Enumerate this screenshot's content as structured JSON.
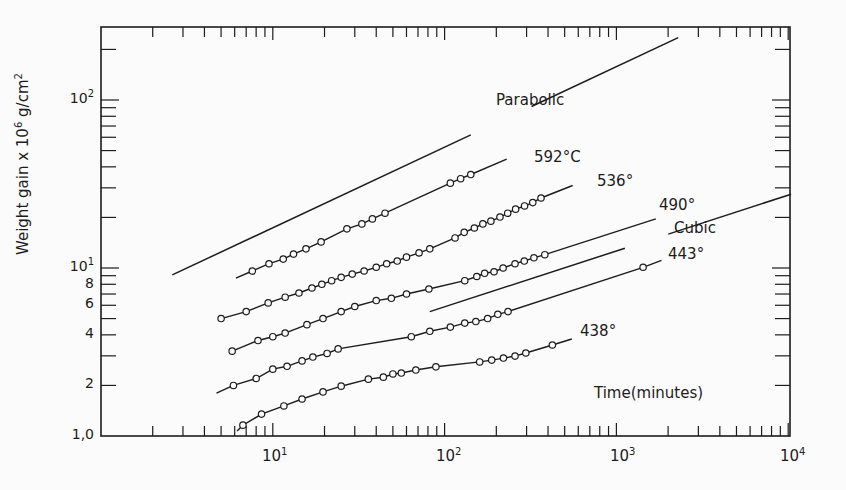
{
  "chart_data": {
    "type": "line",
    "title": "",
    "xlabel": "Time(minutes)",
    "ylabel": "Weight gain x 10^6 g/cm^2",
    "xscale": "log",
    "yscale": "log",
    "xlim": [
      1,
      10000
    ],
    "ylim": [
      1.0,
      272
    ],
    "grid": false,
    "legend": "inline labels",
    "x_tick_labels": [
      "10^1",
      "10^2",
      "10^3",
      "10^4"
    ],
    "y_tick_labels": [
      "1,0",
      "2",
      "4",
      "6",
      "8",
      "10^1",
      "10^2"
    ],
    "reference_lines": [
      {
        "name": "Parabolic",
        "x": [
          2.6,
          2290
        ],
        "y": [
          9.1,
          235
        ]
      },
      {
        "name": "Cubic",
        "x": [
          82,
          10400
        ],
        "y": [
          5.5,
          27.5
        ]
      }
    ],
    "series": [
      {
        "name": "592°C",
        "line": {
          "x": [
            6.1,
            230
          ],
          "y": [
            8.7,
            44.4
          ]
        },
        "x": [
          7.6,
          9.5,
          11.5,
          13.2,
          15.6,
          19.1,
          27,
          33,
          38,
          45,
          108,
          124,
          142
        ],
        "y": [
          9.6,
          10.6,
          11.3,
          12.1,
          13.0,
          14.3,
          17.1,
          18.3,
          19.6,
          21.2,
          32,
          34,
          36
        ]
      },
      {
        "name": "536°",
        "line": {
          "x": [
            5.0,
            556
          ],
          "y": [
            5.0,
            31.0
          ]
        },
        "x": [
          5.0,
          7.0,
          9.4,
          11.8,
          14.2,
          16.9,
          19.3,
          22,
          25,
          29,
          34,
          40,
          46,
          53,
          60,
          71,
          82,
          115,
          130,
          149,
          167,
          186,
          210,
          233,
          259,
          292,
          326,
          364
        ],
        "y": [
          5.0,
          5.5,
          6.2,
          6.7,
          7.1,
          7.6,
          8.0,
          8.4,
          8.8,
          9.2,
          9.6,
          10.1,
          10.6,
          11.0,
          11.6,
          12.3,
          13.0,
          15.1,
          16.3,
          17.3,
          18.3,
          19.0,
          20.1,
          21.2,
          22.4,
          23.4,
          24.5,
          26.1
        ]
      },
      {
        "name": "490°",
        "line": {
          "x": [
            5.8,
            1695
          ],
          "y": [
            3.2,
            19.6
          ]
        },
        "x": [
          5.8,
          8.2,
          10,
          11.8,
          15.8,
          19.6,
          25,
          30,
          40,
          49,
          60,
          81,
          131,
          154,
          171,
          194,
          219,
          257,
          291,
          331,
          383
        ],
        "y": [
          3.2,
          3.7,
          3.9,
          4.1,
          4.6,
          5.0,
          5.5,
          5.9,
          6.4,
          6.6,
          7.0,
          7.5,
          8.4,
          8.9,
          9.3,
          9.5,
          10.0,
          10.6,
          11.0,
          11.5,
          12.0
        ]
      },
      {
        "name": "443°",
        "line": {
          "x": [
            4.7,
            1830
          ],
          "y": [
            1.8,
            11.1
          ]
        },
        "x": [
          5.9,
          8.0,
          10,
          12.1,
          14.8,
          17.1,
          20.7,
          24,
          64,
          82,
          108,
          131,
          152,
          178,
          204,
          234,
          1430
        ],
        "y": [
          2.0,
          2.2,
          2.5,
          2.6,
          2.8,
          2.95,
          3.1,
          3.3,
          3.9,
          4.2,
          4.45,
          4.7,
          4.8,
          5.0,
          5.3,
          5.5,
          10.1
        ]
      },
      {
        "name": "438°",
        "line": {
          "x": [
            6.2,
            550
          ],
          "y": [
            1.07,
            3.78
          ]
        },
        "x": [
          6.7,
          8.6,
          11.6,
          14.8,
          19.6,
          25,
          36,
          44,
          50,
          56,
          68,
          89,
          160,
          188,
          220,
          257,
          297,
          424
        ],
        "y": [
          1.16,
          1.35,
          1.51,
          1.66,
          1.83,
          1.98,
          2.18,
          2.24,
          2.34,
          2.37,
          2.47,
          2.58,
          2.76,
          2.83,
          2.91,
          2.99,
          3.12,
          3.48
        ]
      }
    ],
    "annotations": [
      "Parabolic",
      "592°C",
      "536°",
      "490°",
      "Cubic",
      "443°",
      "438°",
      "Time(minutes)"
    ]
  },
  "labels": {
    "parabolic": "Parabolic",
    "s592": "592°C",
    "s536": "536°",
    "s490": "490°",
    "cubic": "Cubic",
    "s443": "443°",
    "s438": "438°",
    "xlabel": "Time(minutes)",
    "ylabel_main": "Weight gain x 10",
    "ylabel_exp": "6",
    "ylabel_unit": " g/cm",
    "ylabel_unit_exp": "2",
    "x10": "10",
    "x10e": "1",
    "x100": "10",
    "x100e": "2",
    "x1000": "10",
    "x1000e": "3",
    "x10000": "10",
    "x10000e": "4",
    "y10": "10",
    "y10e": "1",
    "y100": "10",
    "y100e": "2",
    "y1": "1,0",
    "y2": "2",
    "y4": "4",
    "y6": "6",
    "y8": "8"
  }
}
